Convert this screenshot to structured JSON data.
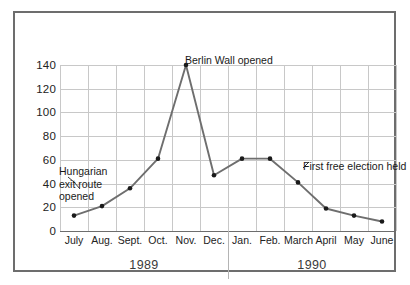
{
  "chart_data": {
    "type": "line",
    "title": "",
    "xlabel": "",
    "ylabel": "",
    "ylim": [
      0,
      140
    ],
    "ytick_values": [
      0,
      20,
      40,
      60,
      80,
      100,
      120,
      140
    ],
    "ytick_labels": [
      "0",
      "20",
      "40",
      "60",
      "80",
      "100",
      "120",
      "140"
    ],
    "grid": "both",
    "legend": "none",
    "categories": [
      "July",
      "Aug.",
      "Sept.",
      "Oct.",
      "Nov.",
      "Dec.",
      "Jan.",
      "Feb.",
      "March",
      "April",
      "May",
      "June"
    ],
    "values": [
      13,
      21,
      36,
      61,
      140,
      47,
      61,
      61,
      41,
      19,
      13,
      8
    ],
    "series": [
      {
        "name": "",
        "values": [
          13,
          21,
          36,
          61,
          140,
          47,
          61,
          61,
          41,
          19,
          13,
          8
        ]
      }
    ],
    "group_labels": [
      {
        "label": "1989",
        "span": [
          "July",
          "Dec."
        ]
      },
      {
        "label": "1990",
        "span": [
          "Jan.",
          "June"
        ]
      }
    ],
    "annotations": [
      {
        "text": "Hungarian\nexit route\nopened",
        "points_to": "Aug."
      },
      {
        "text": "Berlin Wall opened",
        "points_to": "Nov."
      },
      {
        "text": "First free election held",
        "points_to": "March"
      }
    ],
    "colors": {
      "line": "#6e6e6e",
      "marker": "#1a1a1a",
      "grid": "#c8c8c8",
      "axis": "#6d6d6d",
      "frame": "#6d6d6d",
      "text": "#1a1a1a"
    }
  }
}
